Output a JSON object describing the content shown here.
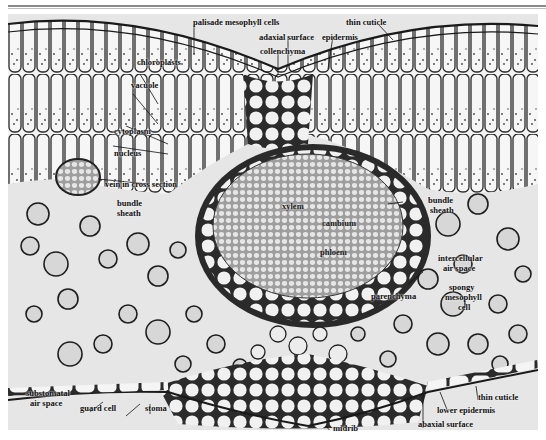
{
  "figure": {
    "labels": {
      "palisade": "palisade mesophyll cells",
      "thin_cuticle_top": "thin cuticle",
      "adaxial_surface": "adaxial surface",
      "epidermis": "epidermis",
      "collenchyma": "collenchyma",
      "chloroplasts": "chloroplasts",
      "vacuole": "vacuole",
      "cytoplasm": "cytoplasm",
      "nucleus": "nucleus",
      "vein": "vein in cross section",
      "bundle_sheath_left_1": "bundle",
      "bundle_sheath_left_2": "sheath",
      "xylem": "xylem",
      "cambium": "cambium",
      "phloem": "phloem",
      "bundle_sheath_right_1": "bundle",
      "bundle_sheath_right_2": "sheath",
      "intercellular_1": "intercellular",
      "intercellular_2": "air space",
      "parenchyma": "parenchyma",
      "spongy_1": "spongy",
      "spongy_2": "mesophyll",
      "spongy_3": "cell",
      "substomatal_1": "substomatal",
      "substomatal_2": "air space",
      "guard_cell": "guard cell",
      "stoma": "stoma",
      "midrib": "midrib",
      "thin_cuticle_bottom": "thin cuticle",
      "lower_epidermis": "lower epidermis",
      "abaxial_surface": "abaxial surface"
    },
    "colors": {
      "background": "#e9e9e9",
      "cell_wall": "#1a1a1a",
      "cell_fill": "#f4f4f4",
      "vascular_fill": "#bdbdbd"
    }
  }
}
